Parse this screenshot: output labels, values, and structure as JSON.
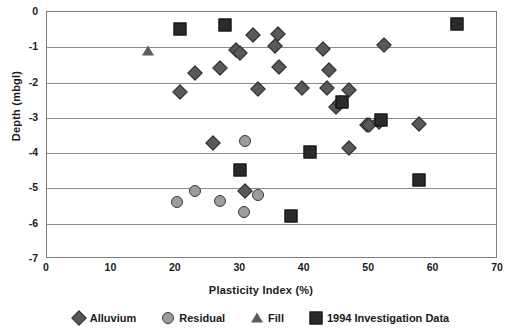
{
  "chart_data": {
    "type": "scatter",
    "title": "",
    "xlabel": "Plasticity Index (%)",
    "ylabel": "Depth (mbgl)",
    "xlim": [
      0,
      70
    ],
    "ylim": [
      -7,
      0
    ],
    "xticks": [
      0,
      10,
      20,
      30,
      40,
      50,
      60,
      70
    ],
    "yticks": [
      0,
      -1,
      -2,
      -3,
      -4,
      -5,
      -6,
      -7
    ],
    "grid": "horizontal",
    "legend_position": "bottom",
    "series": [
      {
        "name": "Alluvium",
        "marker": "diamond",
        "color": "#595959",
        "points": [
          [
            32.0,
            -0.64
          ],
          [
            35.9,
            -0.62
          ],
          [
            29.3,
            -1.08
          ],
          [
            30.0,
            -1.16
          ],
          [
            35.4,
            -0.95
          ],
          [
            52.3,
            -0.94
          ],
          [
            42.9,
            -1.06
          ],
          [
            23.0,
            -1.73
          ],
          [
            26.8,
            -1.58
          ],
          [
            36.0,
            -1.56
          ],
          [
            43.7,
            -1.64
          ],
          [
            20.6,
            -2.28
          ],
          [
            32.8,
            -2.17
          ],
          [
            39.6,
            -2.16
          ],
          [
            43.5,
            -2.15
          ],
          [
            46.8,
            -2.21
          ],
          [
            44.9,
            -2.68
          ],
          [
            45.4,
            -2.58
          ],
          [
            49.6,
            -3.21
          ],
          [
            50.0,
            -3.2
          ],
          [
            51.6,
            -3.12
          ],
          [
            57.7,
            -3.18
          ],
          [
            25.8,
            -3.71
          ],
          [
            46.9,
            -3.85
          ],
          [
            30.7,
            -5.06
          ]
        ]
      },
      {
        "name": "Residual",
        "marker": "circle",
        "color": "#9d9d9d",
        "points": [
          [
            30.8,
            -3.66
          ],
          [
            22.9,
            -5.08
          ],
          [
            20.1,
            -5.39
          ],
          [
            26.8,
            -5.35
          ],
          [
            32.8,
            -5.18
          ],
          [
            30.6,
            -5.66
          ]
        ]
      },
      {
        "name": "Fill",
        "marker": "triangle",
        "color": "#5b5b5b",
        "points": [
          [
            15.7,
            -1.11
          ]
        ]
      },
      {
        "name": "1994 Investigation Data",
        "marker": "square",
        "color": "#2b2b2b",
        "points": [
          [
            20.6,
            -0.48
          ],
          [
            27.7,
            -0.36
          ],
          [
            63.6,
            -0.34
          ],
          [
            45.8,
            -2.56
          ],
          [
            51.8,
            -3.06
          ],
          [
            40.8,
            -3.96
          ],
          [
            30.0,
            -4.47
          ],
          [
            57.8,
            -4.75
          ],
          [
            37.8,
            -5.77
          ]
        ]
      }
    ]
  },
  "axes": {
    "x_title": "Plasticity Index (%)",
    "y_title": "Depth (mbgl)",
    "x_ticks": [
      "0",
      "10",
      "20",
      "30",
      "40",
      "50",
      "60",
      "70"
    ],
    "y_ticks": [
      "0",
      "-1",
      "-2",
      "-3",
      "-4",
      "-5",
      "-6",
      "-7"
    ]
  },
  "legend": {
    "items": [
      {
        "label": "Alluvium",
        "marker": "diamond"
      },
      {
        "label": "Residual",
        "marker": "circle"
      },
      {
        "label": "Fill",
        "marker": "triangle"
      },
      {
        "label": "1994 Investigation Data",
        "marker": "square"
      }
    ]
  }
}
